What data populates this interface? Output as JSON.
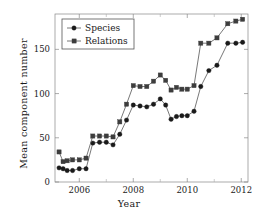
{
  "chart_data": {
    "type": "line",
    "title": "",
    "xlabel": "Year",
    "ylabel": "Mean component number",
    "xlim": [
      2005.1,
      2012.25
    ],
    "ylim": [
      0,
      190
    ],
    "grid": false,
    "legend_position": "top-left",
    "xticks_major": [
      2006,
      2008,
      2010,
      2012
    ],
    "xticks_minor": [
      2005,
      2007,
      2009,
      2011
    ],
    "yticks": [
      0,
      50,
      100,
      150
    ],
    "x": [
      2005.25,
      2005.4,
      2005.55,
      2005.75,
      2006.0,
      2006.25,
      2006.5,
      2006.75,
      2007.0,
      2007.25,
      2007.5,
      2007.75,
      2008.0,
      2008.25,
      2008.5,
      2008.75,
      2009.0,
      2009.2,
      2009.4,
      2009.6,
      2009.8,
      2010.0,
      2010.25,
      2010.5,
      2010.8,
      2011.1,
      2011.5,
      2011.8,
      2012.05
    ],
    "series": [
      {
        "name": "Species",
        "marker": "circle",
        "color": "#1a1a1a",
        "values": [
          16,
          15,
          13,
          13,
          15,
          15,
          44,
          45,
          45,
          42,
          54,
          70,
          87,
          86,
          85,
          88,
          94,
          87,
          71,
          74,
          75,
          75,
          80,
          108,
          126,
          132,
          157,
          157,
          158
        ]
      },
      {
        "name": "Relations",
        "marker": "square",
        "color": "#3d3d3d",
        "values": [
          34,
          23,
          24,
          25,
          25,
          27,
          52,
          52,
          52,
          51,
          68,
          88,
          109,
          108,
          108,
          114,
          121,
          115,
          104,
          107,
          105,
          105,
          109,
          157,
          157,
          163,
          179,
          182,
          184
        ]
      }
    ]
  },
  "legend": {
    "entries": [
      {
        "label": "Species"
      },
      {
        "label": "Relations"
      }
    ]
  }
}
